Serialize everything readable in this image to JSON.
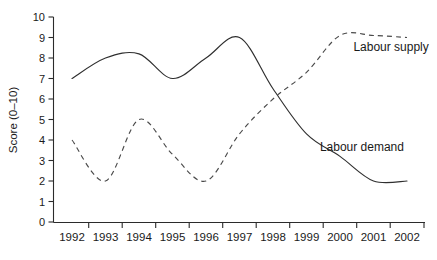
{
  "chart_data": {
    "type": "line",
    "title": "",
    "xlabel": "",
    "ylabel": "Score (0–10)",
    "categories": [
      "1992",
      "1993",
      "1994",
      "1995",
      "1996",
      "1997",
      "1998",
      "1999",
      "2000",
      "2001",
      "2002"
    ],
    "x": [
      1992,
      1993,
      1994,
      1995,
      1996,
      1997,
      1998,
      1999,
      2000,
      2001,
      2002
    ],
    "ylim": [
      0,
      10
    ],
    "xlim": [
      1992,
      2002
    ],
    "yticks": [
      "0",
      "1",
      "2",
      "3",
      "4",
      "5",
      "6",
      "7",
      "8",
      "9",
      "10"
    ],
    "grid": false,
    "legend_position": "inline-right",
    "series": [
      {
        "name": "Labour demand",
        "style": "solid",
        "color": "#2f2f2f",
        "values": [
          7.0,
          8.0,
          8.2,
          7.0,
          8.0,
          9.0,
          6.5,
          4.3,
          3.2,
          2.0,
          2.0
        ]
      },
      {
        "name": "Labour supply",
        "style": "dashed",
        "color": "#4a4a4a",
        "values": [
          4.0,
          2.0,
          5.0,
          3.3,
          2.0,
          4.3,
          6.0,
          7.3,
          9.1,
          9.1,
          9.0
        ]
      }
    ],
    "annotations": [
      {
        "text": "Labour supply",
        "x": 2000.4,
        "y": 8.55
      },
      {
        "text": "Labour demand",
        "x": 1999.4,
        "y": 3.65
      }
    ]
  }
}
